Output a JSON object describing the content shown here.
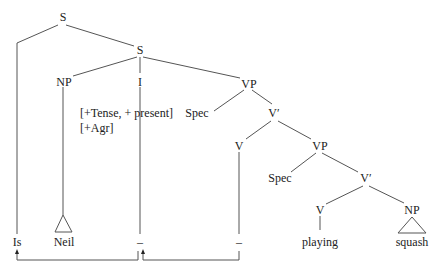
{
  "diagram": {
    "type": "syntax-tree",
    "nodes": {
      "s_root": "S",
      "s_inner": "S",
      "np_subject": "NP",
      "i_head": "I",
      "i_features_line1": "[+Tense, + present]",
      "i_features_line2": "[+Agr]",
      "vp_upper": "VP",
      "spec_upper": "Spec",
      "vbar_upper": "V′",
      "v_upper": "V",
      "vp_lower": "VP",
      "spec_lower": "Spec",
      "vbar_lower": "V′",
      "v_lower": "V",
      "np_object": "NP"
    },
    "leaves": {
      "moved_aux": "Is",
      "subject": "Neil",
      "i_trace": "–",
      "v_trace": "–",
      "verb": "playing",
      "object": "squash"
    },
    "movements": [
      {
        "from": "i_trace",
        "to": "moved_aux",
        "label": "I-to-S movement"
      },
      {
        "from": "v_trace",
        "to": "i_trace",
        "label": "V-to-I movement"
      }
    ]
  }
}
